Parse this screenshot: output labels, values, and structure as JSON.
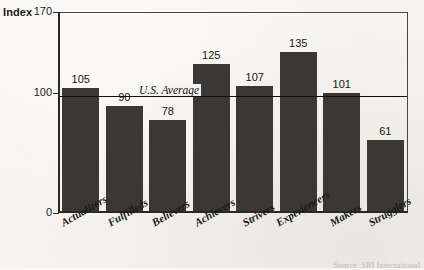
{
  "chart_data": {
    "type": "bar",
    "title": "",
    "subtitle": "",
    "xlabel": "",
    "ylabel": "Index",
    "ylim": [
      0,
      170
    ],
    "yticks": [
      "170",
      "100",
      "0"
    ],
    "grid": false,
    "legend_position": "none",
    "categories": [
      "Actualizers",
      "Fulfilleds",
      "Believers",
      "Achievers",
      "Strivers",
      "Experiencers",
      "Makers",
      "Strugglers"
    ],
    "values": [
      105,
      90,
      78,
      125,
      107,
      135,
      101,
      61
    ],
    "value_labels": [
      "105",
      "90",
      "78",
      "125",
      "107",
      "135",
      "101",
      "61"
    ],
    "bar_color": "#3b3734",
    "annotations": [
      {
        "name": "us-average-line",
        "label": "U.S. Average",
        "value": 100,
        "color": "#100f0c"
      }
    ],
    "source": "Source: SRI International"
  },
  "axis": {
    "index_title": "Index",
    "tick_top": "170",
    "tick_mid": "100",
    "tick_bottom": "0"
  }
}
